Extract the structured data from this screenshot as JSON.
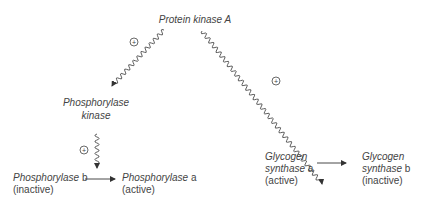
{
  "diagram": {
    "top_node": {
      "label": "Protein kinase A"
    },
    "phosphorylase_kinase": {
      "line1": "Phosphorylase",
      "line2": "kinase"
    },
    "phosphorylase_b": {
      "name": "Phosphorylase",
      "form": "b",
      "state": "(inactive)"
    },
    "phosphorylase_a": {
      "name": "Phosphorylase",
      "form": "a",
      "state": "(active)"
    },
    "glycogen_synthase_a": {
      "line1": "Glycogen",
      "name": "synthase",
      "form": "a",
      "state": "(active)"
    },
    "glycogen_synthase_b": {
      "line1": "Glycogen",
      "name": "synthase",
      "form": "b",
      "state": "(inactive)"
    },
    "activation_symbol": "+",
    "edges": [
      {
        "from": "Protein kinase A",
        "to": "Phosphorylase kinase",
        "type": "wavy",
        "sign": "+"
      },
      {
        "from": "Protein kinase A",
        "to": "Glycogen synthase a",
        "type": "wavy",
        "sign": "+"
      },
      {
        "from": "Phosphorylase kinase",
        "to": "Phosphorylase b -> a",
        "type": "wavy",
        "sign": "+"
      },
      {
        "from": "Phosphorylase b",
        "to": "Phosphorylase a",
        "type": "straight"
      },
      {
        "from": "Glycogen synthase a",
        "to": "Glycogen synthase b",
        "type": "straight"
      }
    ]
  },
  "colors": {
    "line": "#4a4a4a",
    "text": "#444444",
    "background": "#ffffff"
  }
}
